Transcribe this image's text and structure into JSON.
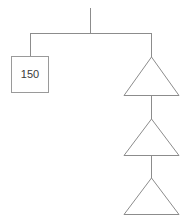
{
  "diagram": {
    "type": "tree-diagram",
    "background_color": "#ffffff",
    "line_color": "#8c8c8c",
    "box_stroke_color": "#9a9a9a",
    "label_color": "#3a3a3a",
    "root_stem": {
      "name": "root-stem",
      "x": 90,
      "y_top": 8,
      "y_bottom": 33
    },
    "branch_bar": {
      "name": "branch-bar",
      "y": 33,
      "x_left": 30,
      "x_right": 151
    },
    "nodes": [
      {
        "id": "box-node",
        "shape": "rectangle",
        "label": "150",
        "x": 11,
        "y": 56,
        "width": 37,
        "height": 36,
        "connector": {
          "x": 30,
          "y_top": 33,
          "y_bottom": 56
        }
      },
      {
        "id": "triangle-node-1",
        "shape": "triangle",
        "label": "",
        "apex_x": 151,
        "apex_y": 57,
        "base_y": 95,
        "base_left_x": 124,
        "base_right_x": 179,
        "connector": {
          "x": 151,
          "y_top": 33,
          "y_bottom": 57
        }
      },
      {
        "id": "triangle-node-2",
        "shape": "triangle",
        "label": "",
        "apex_x": 151,
        "apex_y": 119,
        "base_y": 155,
        "base_left_x": 124,
        "base_right_x": 179,
        "connector": {
          "x": 151,
          "y_top": 95,
          "y_bottom": 119
        }
      },
      {
        "id": "triangle-node-3",
        "shape": "triangle",
        "label": "",
        "apex_x": 151,
        "apex_y": 178,
        "base_y": 214,
        "base_left_x": 124,
        "base_right_x": 179,
        "connector": {
          "x": 151,
          "y_top": 155,
          "y_bottom": 178
        }
      }
    ]
  }
}
